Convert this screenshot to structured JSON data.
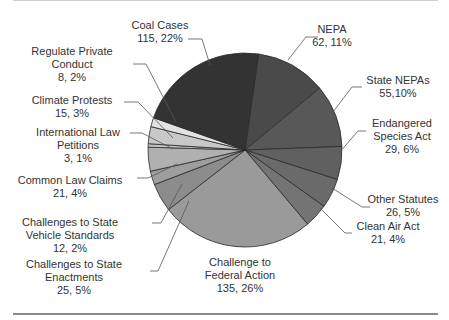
{
  "chart_data": {
    "type": "pie",
    "title": "",
    "start_angle_deg": 8,
    "direction": "clockwise",
    "slices": [
      {
        "label": "NEPA",
        "value": 62,
        "percent": 11,
        "text": "62, 11%",
        "color": "#4a4a4a"
      },
      {
        "label": "State NEPAs",
        "value": 55,
        "percent": 10,
        "text": "55,10%",
        "color": "#585858"
      },
      {
        "label": "Endangered Species Act",
        "value": 29,
        "percent": 6,
        "text": "29, 6%",
        "color": "#606060"
      },
      {
        "label": "Other Statutes",
        "value": 26,
        "percent": 5,
        "text": "26, 5%",
        "color": "#6a6a6a"
      },
      {
        "label": "Clean Air Act",
        "value": 21,
        "percent": 4,
        "text": "21, 4%",
        "color": "#747474"
      },
      {
        "label": "Challenge to Federal Action",
        "value": 135,
        "percent": 26,
        "text": "135, 26%",
        "color": "#9a9a9a"
      },
      {
        "label": "Challenges to State Enactments",
        "value": 25,
        "percent": 5,
        "text": "25, 5%",
        "color": "#8c8c8c"
      },
      {
        "label": "Challenges to State Vehicle Standards",
        "value": 12,
        "percent": 2,
        "text": "12, 2%",
        "color": "#9e9e9e"
      },
      {
        "label": "Common Law Claims",
        "value": 21,
        "percent": 4,
        "text": "21, 4%",
        "color": "#b0b0b0"
      },
      {
        "label": "International Law Petitions",
        "value": 3,
        "percent": 1,
        "text": "3, 1%",
        "color": "#c4c4c4"
      },
      {
        "label": "Climate Protests",
        "value": 15,
        "percent": 3,
        "text": "15, 3%",
        "color": "#c8c8c8"
      },
      {
        "label": "Regulate Private Conduct",
        "value": 8,
        "percent": 2,
        "text": "8, 2%",
        "color": "#e2e2e2"
      },
      {
        "label": "Coal Cases",
        "value": 115,
        "percent": 22,
        "text": "115, 22%",
        "color": "#333333"
      }
    ],
    "legend": "none (callout labels)"
  },
  "labels": {
    "nepa": {
      "l1": "NEPA",
      "l2": "62, 11%"
    },
    "state_nepas": {
      "l1": "State NEPAs",
      "l2": "55,10%"
    },
    "esa": {
      "l1": "Endangered",
      "l2": "Species Act",
      "l3": "29, 6%"
    },
    "other": {
      "l1": "Other Statutes",
      "l2": "26, 5%"
    },
    "caa": {
      "l1": "Clean Air Act",
      "l2": "21, 4%"
    },
    "federal": {
      "l1": "Challenge to",
      "l2": "Federal Action",
      "l3": "135, 26%"
    },
    "enact": {
      "l1": "Challenges to State",
      "l2": "Enactments",
      "l3": "25, 5%"
    },
    "vehicle": {
      "l1": "Challenges to State",
      "l2": "Vehicle Standards",
      "l3": "12, 2%"
    },
    "common": {
      "l1": "Common Law Claims",
      "l2": "21, 4%"
    },
    "intl": {
      "l1": "International Law",
      "l2": "Petitions",
      "l3": "3, 1%"
    },
    "protests": {
      "l1": "Climate Protests",
      "l2": "15, 3%"
    },
    "private": {
      "l1": "Regulate Private",
      "l2": "Conduct",
      "l3": "8, 2%"
    },
    "coal": {
      "l1": "Coal Cases",
      "l2": "115, 22%"
    }
  }
}
